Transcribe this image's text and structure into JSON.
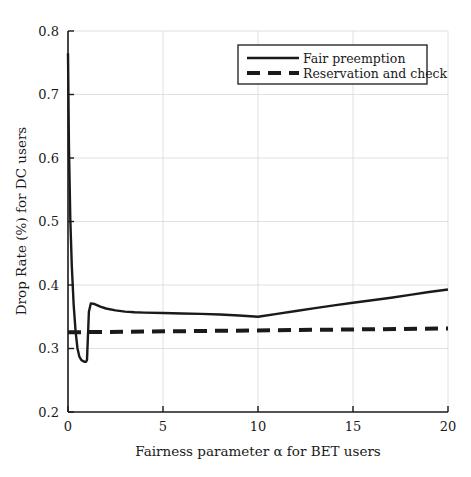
{
  "chart_data": {
    "type": "line",
    "title": "",
    "xlabel": "Fairness parameter α  for BET users",
    "ylabel": "Drop Rate (%) for DC users",
    "xlim": [
      0,
      20
    ],
    "ylim": [
      0.2,
      0.8
    ],
    "xticks": [
      0,
      5,
      10,
      15,
      20
    ],
    "xtick_labels": [
      "0",
      "5",
      "10",
      "15",
      "20"
    ],
    "yticks": [
      0.2,
      0.3,
      0.4,
      0.5,
      0.6,
      0.7,
      0.8
    ],
    "ytick_labels": [
      "0.2",
      "0.3",
      "0.4",
      "0.5",
      "0.6",
      "0.7",
      "0.8"
    ],
    "grid": true,
    "legend_position": "top-right",
    "series": [
      {
        "name": "Fair preemption",
        "style": "solid",
        "color": "#1a1a1a",
        "width": 2.4,
        "x": [
          0.0,
          0.05,
          0.12,
          0.2,
          0.3,
          0.4,
          0.5,
          0.6,
          0.7,
          0.8,
          0.88,
          0.95,
          1.0,
          1.05,
          1.1,
          1.2,
          1.4,
          1.7,
          2.0,
          2.5,
          3.0,
          3.5,
          4.0,
          5.0,
          6.0,
          7.0,
          8.0,
          9.0,
          10.0,
          11.0,
          12.0,
          13.0,
          14.0,
          15.0,
          16.0,
          17.0,
          18.0,
          19.0,
          20.0
        ],
        "y": [
          0.765,
          0.618,
          0.505,
          0.43,
          0.368,
          0.327,
          0.3,
          0.287,
          0.282,
          0.28,
          0.279,
          0.279,
          0.282,
          0.32,
          0.358,
          0.371,
          0.37,
          0.366,
          0.363,
          0.36,
          0.358,
          0.357,
          0.3565,
          0.3558,
          0.3552,
          0.3545,
          0.3535,
          0.352,
          0.35,
          0.3545,
          0.359,
          0.3635,
          0.368,
          0.372,
          0.376,
          0.38,
          0.3845,
          0.389,
          0.393
        ]
      },
      {
        "name": "Reservation and check",
        "style": "dashed",
        "color": "#1a1a1a",
        "width": 4.0,
        "x": [
          0.0,
          20.0
        ],
        "y": [
          0.3255,
          0.3315
        ]
      }
    ]
  },
  "legend": {
    "entries": [
      {
        "label": "Fair preemption",
        "style": "solid"
      },
      {
        "label": "Reservation and check",
        "style": "dashed"
      }
    ]
  }
}
